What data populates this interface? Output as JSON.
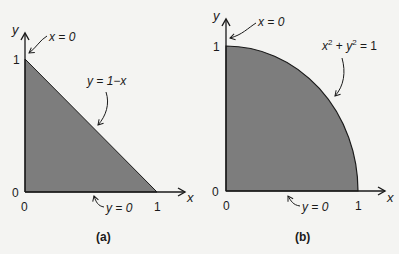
{
  "colors": {
    "background": "#f4f4f2",
    "region_fill": "#7d7d7d",
    "line": "#1a1a1a"
  },
  "panel_a": {
    "caption": "(a)",
    "y_axis_label": "y",
    "x_axis_label": "x",
    "ticks": {
      "origin_y": "0",
      "origin_x": "0",
      "y_one": "1",
      "x_one": "1"
    },
    "boundary_left_label": "x = 0",
    "boundary_hyp_label": "y = 1−x",
    "boundary_bottom_label": "y = 0",
    "region": "triangle"
  },
  "panel_b": {
    "caption": "(b)",
    "y_axis_label": "y",
    "x_axis_label": "x",
    "ticks": {
      "origin_y": "0",
      "origin_x": "0",
      "y_one": "1",
      "x_one": "1"
    },
    "boundary_left_label": "x = 0",
    "boundary_curve_label": {
      "x": "x",
      "sup1": "2",
      "plus": " + ",
      "y": "y",
      "sup2": "2",
      "rhs": " = 1"
    },
    "boundary_bottom_label": "y = 0",
    "region": "quarter-disk"
  }
}
